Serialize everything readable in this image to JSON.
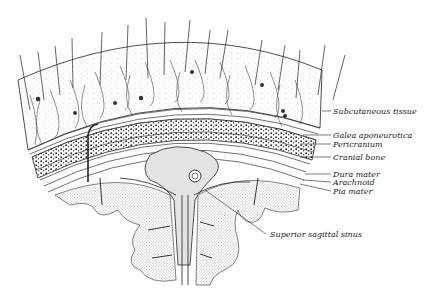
{
  "figure": {
    "colors": {
      "ink": "#1a1a1a",
      "background": "#ffffff",
      "shade": "#d9d9d9",
      "stipple": "#555555"
    }
  },
  "labels": [
    {
      "id": "subcutaneous",
      "text": "Subcutaneous tissue",
      "x": 333,
      "y": 107,
      "lx1": 322,
      "ly1": 111,
      "lx2": 331,
      "ly2": 111
    },
    {
      "id": "galea",
      "text": "Galea aponeurotica",
      "x": 333,
      "y": 131,
      "lx1": 303,
      "ly1": 135,
      "lx2": 331,
      "ly2": 135
    },
    {
      "id": "pericranium",
      "text": "Pericranium",
      "x": 333,
      "y": 140,
      "lx1": 300,
      "ly1": 144,
      "lx2": 331,
      "ly2": 144
    },
    {
      "id": "cranial-bone",
      "text": "Cranial bone",
      "x": 333,
      "y": 153,
      "lx1": 300,
      "ly1": 157,
      "lx2": 331,
      "ly2": 157
    },
    {
      "id": "dura",
      "text": "Dura mater",
      "x": 333,
      "y": 170,
      "lx1": 305,
      "ly1": 174,
      "lx2": 331,
      "ly2": 174
    },
    {
      "id": "arachnoid",
      "text": "Arachnoid",
      "x": 333,
      "y": 178,
      "lx1": 303,
      "ly1": 180,
      "lx2": 331,
      "ly2": 182
    },
    {
      "id": "pia",
      "text": "Pia mater",
      "x": 333,
      "y": 187,
      "lx1": 300,
      "ly1": 184,
      "lx2": 331,
      "ly2": 191
    },
    {
      "id": "sinus",
      "text": "Superior sagittal sinus",
      "x": 270,
      "y": 230,
      "lx1": 205,
      "ly1": 190,
      "lx2": 266,
      "ly2": 234
    }
  ]
}
